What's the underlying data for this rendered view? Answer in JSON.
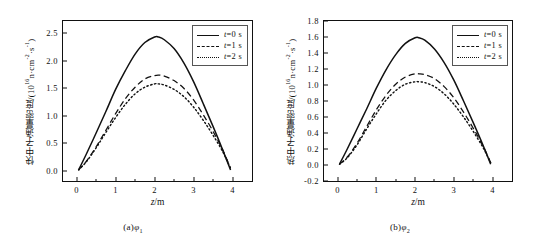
{
  "figure": {
    "panels": [
      {
        "id": "a",
        "subcaption_prefix": "(a)",
        "subcaption_symbol": "φ",
        "subcaption_sub": "1",
        "ylabel_cn": "快中子通量密度",
        "ylabel_unit_prefix": "/(10",
        "ylabel_unit_exp": "16",
        "ylabel_unit_rest": "n·cm",
        "ylabel_unit_exp2": "-2",
        "ylabel_unit_rest2": "·s",
        "ylabel_unit_exp3": "-1",
        "ylabel_unit_close": ")",
        "xlabel_var": "z",
        "xlabel_unit": "/m"
      },
      {
        "id": "b",
        "subcaption_prefix": "(b)",
        "subcaption_symbol": "φ",
        "subcaption_sub": "2",
        "ylabel_cn": "热中子通量密度",
        "ylabel_unit_prefix": "/(10",
        "ylabel_unit_exp": "16",
        "ylabel_unit_rest": "n·cm",
        "ylabel_unit_exp2": "-2",
        "ylabel_unit_rest2": "·s",
        "ylabel_unit_exp3": "-1",
        "ylabel_unit_close": ")",
        "xlabel_var": "z",
        "xlabel_unit": "/m"
      }
    ],
    "legend": {
      "entries": [
        {
          "symbol": "t",
          "value": "=0 s",
          "style": "solid"
        },
        {
          "symbol": "t",
          "value": "=1 s",
          "style": "dashed"
        },
        {
          "symbol": "t",
          "value": "=2 s",
          "style": "dotted"
        }
      ]
    }
  },
  "chart_data": [
    {
      "type": "line",
      "panel": "(a)φ₁",
      "title": "",
      "xlabel": "z/m",
      "ylabel": "快中子通量密度/(10^16 n·cm^-2·s^-1)",
      "xlim": [
        -0.35,
        4.5
      ],
      "ylim": [
        -0.18,
        2.72
      ],
      "xticks": [
        0,
        1,
        2,
        3,
        4
      ],
      "xticklabels": [
        "0",
        "1",
        "2",
        "3",
        "4"
      ],
      "yticks": [
        0.0,
        0.5,
        1.0,
        1.5,
        2.0,
        2.5
      ],
      "yticklabels": [
        "0.0",
        "0.5",
        "1.0",
        "1.5",
        "2.0",
        "2.5"
      ],
      "grid": false,
      "legend_position": "upper right",
      "x": [
        0.05,
        0.25,
        0.5,
        0.75,
        1.0,
        1.25,
        1.5,
        1.75,
        2.0,
        2.1,
        2.25,
        2.5,
        2.75,
        3.0,
        3.25,
        3.5,
        3.75,
        3.95
      ],
      "series": [
        {
          "name": "t=0 s",
          "style": "solid",
          "peak_x": 2.0,
          "peak_y": 2.43,
          "values": [
            0.02,
            0.31,
            0.69,
            1.08,
            1.48,
            1.82,
            2.12,
            2.33,
            2.43,
            2.43,
            2.38,
            2.22,
            1.96,
            1.62,
            1.22,
            0.81,
            0.38,
            0.02
          ]
        },
        {
          "name": "t=1 s",
          "style": "dashed",
          "peak_x": 2.1,
          "peak_y": 1.74,
          "values": [
            0.02,
            0.18,
            0.44,
            0.74,
            1.04,
            1.31,
            1.52,
            1.67,
            1.73,
            1.74,
            1.72,
            1.64,
            1.5,
            1.29,
            1.02,
            0.72,
            0.38,
            0.05
          ]
        },
        {
          "name": "t=2 s",
          "style": "dotted",
          "peak_x": 2.05,
          "peak_y": 1.58,
          "values": [
            0.02,
            0.17,
            0.42,
            0.7,
            0.97,
            1.21,
            1.4,
            1.52,
            1.58,
            1.58,
            1.56,
            1.48,
            1.35,
            1.16,
            0.92,
            0.65,
            0.35,
            0.05
          ]
        }
      ]
    },
    {
      "type": "line",
      "panel": "(b)φ₂",
      "title": "",
      "xlabel": "z/m",
      "ylabel": "热中子通量密度/(10^16 n·cm^-2·s^-1)",
      "xlim": [
        -0.35,
        4.5
      ],
      "ylim": [
        -0.2,
        1.8
      ],
      "xticks": [
        0,
        1,
        2,
        3,
        4
      ],
      "xticklabels": [
        "0",
        "1",
        "2",
        "3",
        "4"
      ],
      "yticks": [
        -0.2,
        0.0,
        0.2,
        0.4,
        0.6,
        0.8,
        1.0,
        1.2,
        1.4,
        1.6,
        1.8
      ],
      "yticklabels": [
        "-0.2",
        "0.0",
        "0.2",
        "0.4",
        "0.6",
        "0.8",
        "1.0",
        "1.2",
        "1.4",
        "1.6",
        "1.8"
      ],
      "grid": false,
      "legend_position": "upper right",
      "x": [
        0.05,
        0.25,
        0.5,
        0.75,
        1.0,
        1.25,
        1.5,
        1.75,
        2.0,
        2.1,
        2.25,
        2.5,
        2.75,
        3.0,
        3.25,
        3.5,
        3.75,
        3.95
      ],
      "series": [
        {
          "name": "t=0 s",
          "style": "solid",
          "peak_x": 2.05,
          "peak_y": 1.59,
          "values": [
            0.01,
            0.2,
            0.45,
            0.7,
            0.96,
            1.19,
            1.38,
            1.52,
            1.59,
            1.59,
            1.56,
            1.45,
            1.28,
            1.06,
            0.8,
            0.53,
            0.25,
            0.01
          ]
        },
        {
          "name": "t=1 s",
          "style": "dashed",
          "peak_x": 2.1,
          "peak_y": 1.14,
          "values": [
            0.01,
            0.1,
            0.27,
            0.48,
            0.69,
            0.87,
            1.01,
            1.1,
            1.14,
            1.14,
            1.13,
            1.08,
            0.98,
            0.84,
            0.66,
            0.46,
            0.24,
            0.03
          ]
        },
        {
          "name": "t=2 s",
          "style": "dotted",
          "peak_x": 2.05,
          "peak_y": 1.04,
          "values": [
            0.01,
            0.09,
            0.25,
            0.45,
            0.64,
            0.81,
            0.93,
            1.01,
            1.04,
            1.04,
            1.03,
            0.98,
            0.89,
            0.76,
            0.6,
            0.42,
            0.22,
            0.03
          ]
        }
      ]
    }
  ]
}
